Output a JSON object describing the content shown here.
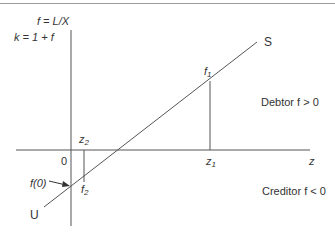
{
  "diagram": {
    "y_axis_label": "f = L/X",
    "y_axis_sublabel": "k = 1 + f",
    "x_axis_label": "z",
    "origin_label": "0",
    "line_start_label": "U",
    "line_end_label": "S",
    "intercept_label": "f(0)",
    "point1": {
      "f_label": "f",
      "f_sub": "1",
      "z_label": "z",
      "z_sub": "1"
    },
    "point2": {
      "f_label": "f",
      "f_sub": "2",
      "z_label": "z",
      "z_sub": "2"
    },
    "region_above": "Debtor f > 0",
    "region_below": "Creditor f < 0",
    "colors": {
      "line": "#555555",
      "text": "#333333"
    }
  }
}
